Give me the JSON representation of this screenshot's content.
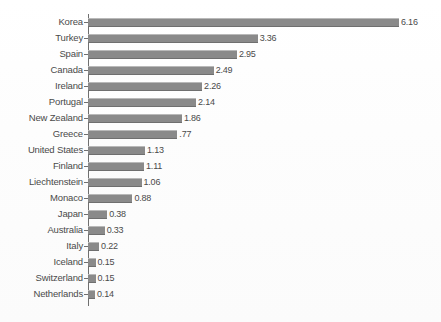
{
  "chart_data": {
    "type": "bar",
    "orientation": "horizontal",
    "title": "",
    "subtitle": "",
    "xlabel": "",
    "ylabel": "",
    "grid": false,
    "legend": false,
    "axis_visible": true,
    "value_labels_shown": true,
    "xlim": [
      0,
      6.16
    ],
    "categories": [
      "Korea",
      "Turkey",
      "Spain",
      "Canada",
      "Ireland",
      "Portugal",
      "New Zealand",
      "Greece",
      "United States",
      "Finland",
      "Liechtenstein",
      "Monaco",
      "Japan",
      "Australia",
      "Italy",
      "Iceland",
      "Switzerland",
      "Netherlands"
    ],
    "values": [
      6.16,
      3.36,
      2.95,
      2.49,
      2.26,
      2.14,
      1.86,
      1.77,
      1.13,
      1.11,
      1.06,
      0.88,
      0.38,
      0.33,
      0.22,
      0.15,
      0.15,
      0.14
    ],
    "value_labels": [
      "6.16",
      "3.36",
      "2.95",
      "2.49",
      "2.26",
      "2.14",
      "1.86",
      ".77",
      "1.13",
      "1.11",
      "1.06",
      "0.88",
      "0.38",
      "0.33",
      "0.22",
      "0.15",
      "0.15",
      "0.14"
    ],
    "colors": {
      "bar": "#8a8a8a",
      "bar_highlight": "#b9b9b9",
      "bar_shadow": "#6f6f6f",
      "text": "#4a4a4a",
      "axis": "#6f6f6f",
      "background": "#fdfdfd"
    }
  }
}
